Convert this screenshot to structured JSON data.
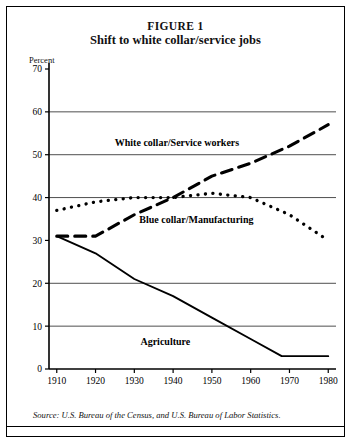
{
  "figure": {
    "label": "FIGURE 1",
    "subtitle": "Shift to white collar/service jobs",
    "axis_unit_label": "Percent",
    "source_note": "Source: U.S. Bureau of the Census, and U.S. Bureau of Labor Statistics."
  },
  "chart_data": {
    "type": "line",
    "title": "Shift to white collar/service jobs",
    "xlabel": "",
    "ylabel": "Percent",
    "xlim": [
      1908,
      1982
    ],
    "ylim": [
      0,
      70
    ],
    "yticks": [
      0,
      10,
      20,
      30,
      40,
      50,
      60,
      70
    ],
    "xticks": [
      1910,
      1920,
      1930,
      1940,
      1950,
      1960,
      1970,
      1980
    ],
    "gridlines": [
      10,
      20,
      40,
      50,
      60
    ],
    "grid": true,
    "legend_position": "inline-annotations",
    "series": [
      {
        "name": "White collar/Service workers",
        "style": "dashed",
        "color": "#000000",
        "x": [
          1910,
          1920,
          1930,
          1940,
          1950,
          1960,
          1970,
          1980
        ],
        "values": [
          31,
          31,
          36,
          40,
          45,
          48,
          52,
          57
        ]
      },
      {
        "name": "Blue collar/Manufacturing",
        "style": "dotted",
        "color": "#000000",
        "x": [
          1910,
          1920,
          1930,
          1940,
          1950,
          1960,
          1970,
          1980
        ],
        "values": [
          37,
          39,
          40,
          40,
          41,
          40,
          36,
          30
        ]
      },
      {
        "name": "Agriculture",
        "style": "solid",
        "color": "#000000",
        "x": [
          1910,
          1920,
          1930,
          1940,
          1950,
          1960,
          1968,
          1980
        ],
        "values": [
          31,
          27,
          21,
          17,
          12,
          7,
          3,
          3
        ]
      }
    ],
    "annotations": [
      {
        "text": "White collar/Service workers",
        "x": 1941,
        "y": 52
      },
      {
        "text": "Blue collar/Manufacturing",
        "x": 1946,
        "y": 34
      },
      {
        "text": "Agriculture",
        "x": 1938,
        "y": 5.5
      }
    ]
  }
}
